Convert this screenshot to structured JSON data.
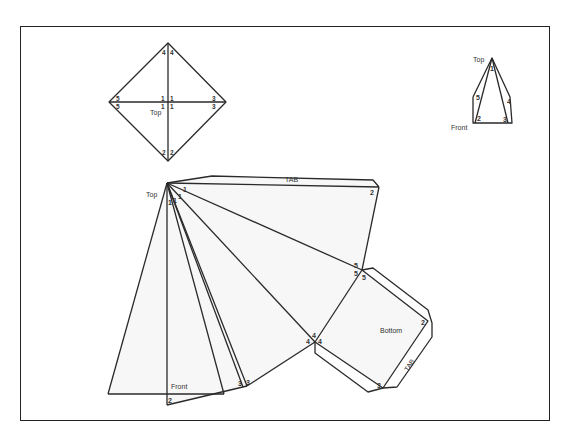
{
  "diagram": {
    "top_view": {
      "label": "Top",
      "vertex_numbers": [
        "1",
        "1",
        "1",
        "1",
        "2",
        "2",
        "3",
        "3",
        "4",
        "4",
        "5",
        "5"
      ]
    },
    "isometric_view": {
      "top_label": "Top",
      "front_label": "Front",
      "vertices": [
        "1",
        "2",
        "3",
        "4",
        "5"
      ]
    },
    "net": {
      "apex_label": "Top",
      "front_label": "Front",
      "bottom_label": "Bottom",
      "tab_top_label": "TAB",
      "tab_bottom_label": "TAB",
      "vertex_labels": {
        "apex": [
          "1",
          "1",
          "1",
          "1"
        ],
        "v2_right": "2",
        "v2_front": "2",
        "v3_a": "3",
        "v3_b": "3",
        "v3_bottom": "3",
        "v4_a": "4",
        "v4_b": "4",
        "v4_c": "4",
        "v5_a": "5",
        "v5_b": "5",
        "v5_c": "5",
        "v2_bottom": "2"
      }
    }
  }
}
